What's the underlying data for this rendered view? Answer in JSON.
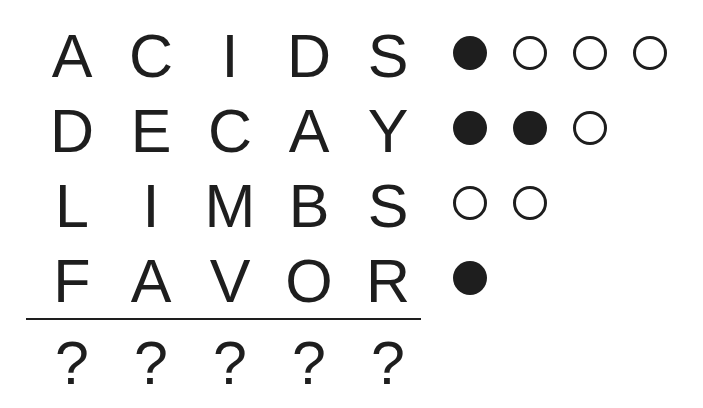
{
  "puzzle": {
    "guesses": [
      {
        "word": "ACIDS",
        "letters": [
          "A",
          "C",
          "I",
          "D",
          "S"
        ],
        "pegs": [
          "filled",
          "empty",
          "empty",
          "empty"
        ]
      },
      {
        "word": "DECAY",
        "letters": [
          "D",
          "E",
          "C",
          "A",
          "Y"
        ],
        "pegs": [
          "filled",
          "filled",
          "empty"
        ]
      },
      {
        "word": "LIMBS",
        "letters": [
          "L",
          "I",
          "M",
          "B",
          "S"
        ],
        "pegs": [
          "empty",
          "empty"
        ]
      },
      {
        "word": "FAVOR",
        "letters": [
          "F",
          "A",
          "V",
          "O",
          "R"
        ],
        "pegs": [
          "filled"
        ]
      }
    ],
    "answer": {
      "letters": [
        "?",
        "?",
        "?",
        "?",
        "?"
      ]
    },
    "legend": {
      "filled": "correct letter in correct position",
      "empty": "correct letter in wrong position"
    },
    "colors": {
      "ink": "#1e1e1e",
      "background": "#ffffff"
    }
  }
}
